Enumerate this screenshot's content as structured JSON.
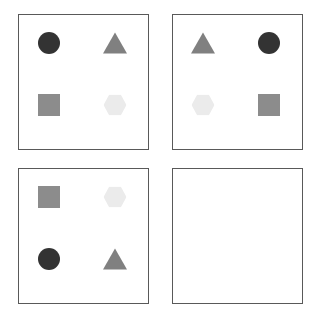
{
  "figure": {
    "type": "visual-analogy-matrix",
    "rows": 2,
    "cols": 2,
    "background_color": "#ffffff",
    "panel_border_color": "#595959"
  },
  "palette": {
    "dark_charcoal": "#333333",
    "medium_gray": "#808080",
    "square_gray": "#8c8c8c",
    "very_light_gray": "#ebebeb",
    "border": "#595959",
    "background": "#ffffff"
  },
  "shape_colors": {
    "circle": "#333333",
    "triangle": "#808080",
    "square": "#8c8c8c",
    "hexagon": "#ebebeb"
  },
  "panels": [
    {
      "id": "panel-1",
      "position": "top-left",
      "empty": false,
      "shapes": [
        {
          "slot": "top-left",
          "name": "circle",
          "color": "#333333"
        },
        {
          "slot": "top-right",
          "name": "triangle",
          "color": "#808080"
        },
        {
          "slot": "bottom-left",
          "name": "square",
          "color": "#8c8c8c"
        },
        {
          "slot": "bottom-right",
          "name": "hexagon",
          "color": "#ebebeb"
        }
      ]
    },
    {
      "id": "panel-2",
      "position": "top-right",
      "empty": false,
      "shapes": [
        {
          "slot": "top-left",
          "name": "triangle",
          "color": "#808080"
        },
        {
          "slot": "top-right",
          "name": "circle",
          "color": "#333333"
        },
        {
          "slot": "bottom-left",
          "name": "hexagon",
          "color": "#ebebeb"
        },
        {
          "slot": "bottom-right",
          "name": "square",
          "color": "#8c8c8c"
        }
      ]
    },
    {
      "id": "panel-3",
      "position": "bottom-left",
      "empty": false,
      "shapes": [
        {
          "slot": "top-left",
          "name": "square",
          "color": "#8c8c8c"
        },
        {
          "slot": "top-right",
          "name": "hexagon",
          "color": "#ebebeb"
        },
        {
          "slot": "bottom-left",
          "name": "circle",
          "color": "#333333"
        },
        {
          "slot": "bottom-right",
          "name": "triangle",
          "color": "#808080"
        }
      ]
    },
    {
      "id": "panel-4",
      "position": "bottom-right",
      "empty": true,
      "shapes": []
    }
  ]
}
